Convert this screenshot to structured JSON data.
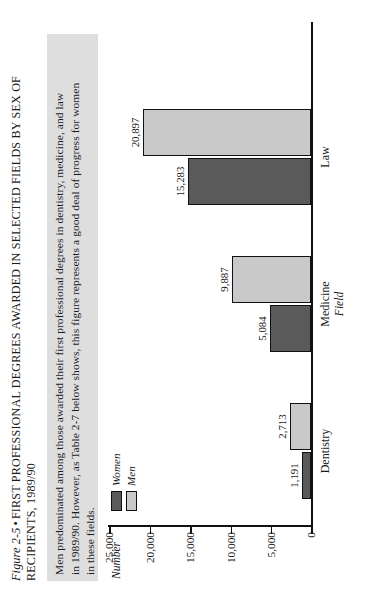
{
  "caption": {
    "figure_label": "Figure 2-5",
    "bullet": "•",
    "title_line1": "FIRST PROFESSIONAL DEGREES AWARDED IN SELECTED FIELDS BY SEX OF",
    "title_line2": "RECIPIENTS, 1989/90"
  },
  "note": {
    "line1": "Men predominated among those awarded their first professional degrees in dentistry, medicine, and law",
    "line2": "in 1989/90. However, as Table 2-7 below shows, this figure represents a good deal of progress for women",
    "line3": "in these fields."
  },
  "legend": {
    "women_label": "Women",
    "men_label": "Men",
    "women_color": "#5a5a5a",
    "men_color": "#c9c9c9"
  },
  "axes": {
    "y_title": "Number",
    "x_title": "Field",
    "y_ticks": [
      "0",
      "5,000",
      "10,000",
      "15,000",
      "20,000",
      "25,000"
    ]
  },
  "chart_data": {
    "type": "bar",
    "title": "FIRST PROFESSIONAL DEGREES AWARDED IN SELECTED FIELDS BY SEX OF RECIPIENTS, 1989/90",
    "xlabel": "Field",
    "ylabel": "Number",
    "ylim": [
      0,
      25000
    ],
    "ytick_values": [
      0,
      5000,
      10000,
      15000,
      20000,
      25000
    ],
    "grid": false,
    "legend_position": "top-left",
    "categories": [
      "Dentistry",
      "Medicine",
      "Law"
    ],
    "series": [
      {
        "name": "Women",
        "color": "#5a5a5a",
        "values": [
          1191,
          5084,
          15283
        ],
        "labels": [
          "1,191",
          "5,084",
          "15,283"
        ]
      },
      {
        "name": "Men",
        "color": "#c9c9c9",
        "values": [
          2713,
          9887,
          20897
        ],
        "labels": [
          "2,713",
          "9,887",
          "20,897"
        ]
      }
    ]
  }
}
